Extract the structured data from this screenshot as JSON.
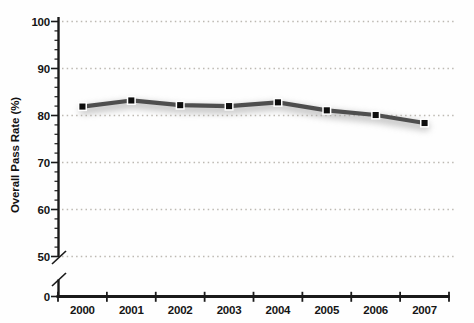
{
  "chart_data": {
    "type": "line",
    "title": "",
    "xlabel": "",
    "ylabel": "Overall Pass Rate (%)",
    "categories": [
      "2000",
      "2001",
      "2002",
      "2003",
      "2004",
      "2005",
      "2006",
      "2007"
    ],
    "series": [
      {
        "name": "Overall Pass Rate (%)",
        "values": [
          81.9,
          83.2,
          82.2,
          82.0,
          82.8,
          81.1,
          80.1,
          78.4
        ]
      }
    ],
    "y_ticks": [
      0,
      50,
      60,
      70,
      80,
      90,
      100
    ],
    "y_tick_labels": [
      "0",
      "50",
      "60",
      "70",
      "80",
      "90",
      "100"
    ],
    "y_minor_tick_step": 2,
    "ylim": [
      50,
      100
    ],
    "y_axis_break_between": [
      0,
      50
    ],
    "grid": {
      "horizontal": true,
      "style": "dotted"
    },
    "legend": "none",
    "marker": "square",
    "colors": {
      "line": "#4e4e4e",
      "line_shadow": "#9f9f9f",
      "marker_fill": "#0d0d0d",
      "marker_border": "#ffffff",
      "gridline": "#bdb9b2",
      "axis": "#1a1a1a",
      "text": "#151515",
      "background": "#fefefe"
    }
  }
}
